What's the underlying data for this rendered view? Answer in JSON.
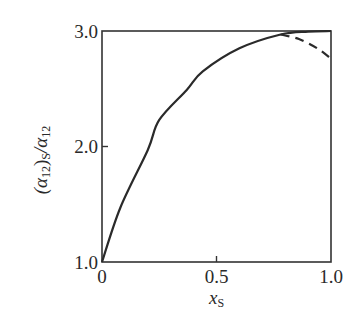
{
  "chart_data": {
    "type": "line",
    "title": "",
    "xlabel": "x_S",
    "ylabel": "(α12)S/α12",
    "xlim": [
      0,
      1.0
    ],
    "ylim": [
      1.0,
      3.0
    ],
    "grid": false,
    "legend": null,
    "x_ticks": [
      "0",
      "0.5",
      "1.0"
    ],
    "y_ticks": [
      "1.0",
      "2.0",
      "3.0"
    ],
    "series": [
      {
        "name": "solid",
        "style": "solid",
        "x": [
          0,
          0.08,
          0.2,
          0.25,
          0.37,
          0.44,
          0.6,
          0.78,
          0.9,
          1.0
        ],
        "y": [
          1.0,
          1.47,
          1.97,
          2.23,
          2.49,
          2.65,
          2.85,
          2.97,
          2.995,
          3.0
        ]
      },
      {
        "name": "dashed",
        "style": "dashed",
        "x": [
          0.78,
          0.86,
          0.94,
          1.0
        ],
        "y": [
          2.97,
          2.93,
          2.85,
          2.76
        ]
      }
    ]
  },
  "labels": {
    "x_tick_0": "0",
    "x_tick_1": "0.5",
    "x_tick_2": "1.0",
    "y_tick_0": "1.0",
    "y_tick_1": "2.0",
    "y_tick_2": "3.0",
    "xlabel_main": "x",
    "xlabel_sub": "S",
    "ylabel_open": "(α",
    "ylabel_sub1": "12",
    "ylabel_close": ")",
    "ylabel_sub2": "S",
    "ylabel_slash": "/α",
    "ylabel_sub3": "12"
  }
}
